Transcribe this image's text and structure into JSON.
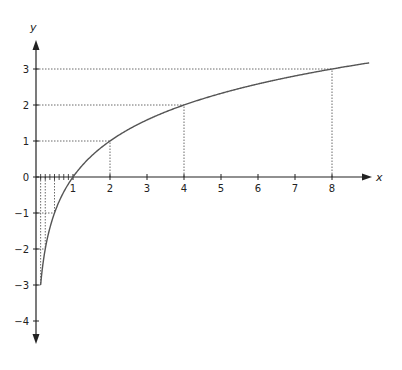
{
  "chart_data": {
    "type": "line",
    "title": "",
    "function": "y = log2(x)",
    "xlabel": "x",
    "ylabel": "y",
    "xlim": [
      0,
      9
    ],
    "ylim": [
      -4.5,
      3.5
    ],
    "grid": false,
    "x_ticks": [
      "1",
      "2",
      "3",
      "4",
      "5",
      "6",
      "7",
      "8"
    ],
    "y_ticks": [
      "3",
      "2",
      "1",
      "0",
      "−1",
      "−2",
      "−3",
      "−4"
    ],
    "minor_x_ticks": [
      0.125,
      0.25,
      0.375,
      0.5,
      0.625,
      0.75,
      0.875
    ],
    "series": [
      {
        "name": "log2(x)",
        "x": [
          0.125,
          0.25,
          0.5,
          1,
          2,
          4,
          8,
          9
        ],
        "y": [
          -3,
          -2,
          -1,
          0,
          1,
          2,
          3,
          3.17
        ]
      }
    ],
    "guide_points": [
      {
        "x": 0.125,
        "y": -3
      },
      {
        "x": 0.25,
        "y": -2
      },
      {
        "x": 0.5,
        "y": -1
      },
      {
        "x": 2,
        "y": 1
      },
      {
        "x": 4,
        "y": 2
      },
      {
        "x": 8,
        "y": 3
      }
    ],
    "origin_label": "0",
    "colors": {
      "curve": "#555555",
      "axis": "#222222",
      "guides": "#444444"
    }
  }
}
